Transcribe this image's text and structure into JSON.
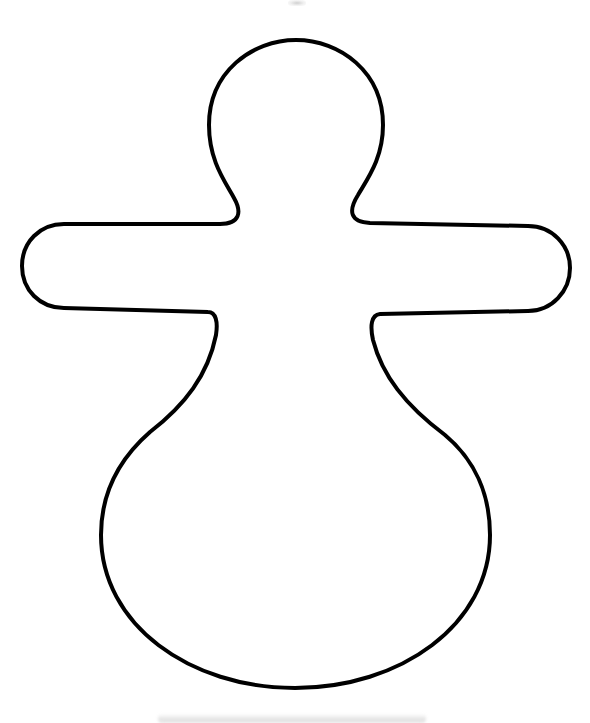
{
  "figure": {
    "stroke_color": "#000000",
    "fill_color": "#ffffff",
    "background_color": "#ffffff",
    "stroke_width": 4
  },
  "decorations": {
    "top_mark_color": "#aaaaaa",
    "bottom_shadow_color": "#dcdcdc"
  }
}
